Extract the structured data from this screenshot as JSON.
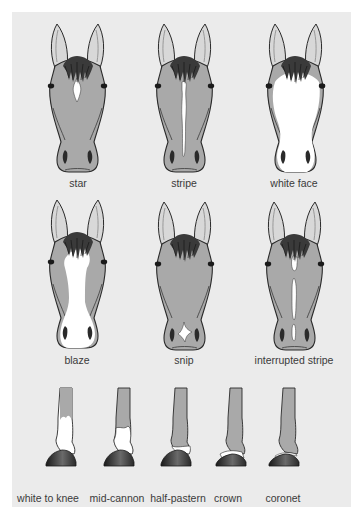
{
  "colors": {
    "background": "#ebebeb",
    "coat": "#a9a9a9",
    "white_marking": "#ffffff",
    "outline": "#2a2a2a",
    "label_text": "#3a3a3a"
  },
  "face_markings": [
    {
      "label": "star",
      "marking": "star"
    },
    {
      "label": "stripe",
      "marking": "stripe"
    },
    {
      "label": "white face",
      "marking": "white-face"
    },
    {
      "label": "blaze",
      "marking": "blaze"
    },
    {
      "label": "snip",
      "marking": "snip"
    },
    {
      "label": "interrupted stripe",
      "marking": "interrupted-stripe"
    }
  ],
  "leg_markings": [
    {
      "label": "white to knee",
      "marking": "white-to-knee"
    },
    {
      "label": "mid-cannon",
      "marking": "mid-cannon"
    },
    {
      "label": "half-pastern",
      "marking": "half-pastern"
    },
    {
      "label": "crown",
      "marking": "crown"
    },
    {
      "label": "coronet",
      "marking": "coronet"
    }
  ]
}
